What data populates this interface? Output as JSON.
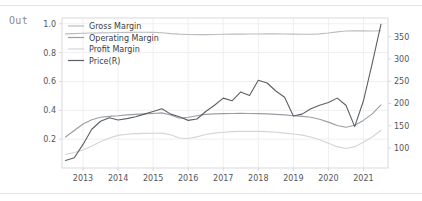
{
  "notebook": {
    "output_prompt": "Out"
  },
  "chart_data": {
    "type": "line",
    "title": "",
    "xlabel": "",
    "ylabel": "",
    "grid": true,
    "legend_position": "upper-left",
    "x": [
      2012.5,
      2012.75,
      2013.0,
      2013.25,
      2013.5,
      2013.75,
      2014.0,
      2014.25,
      2014.5,
      2014.75,
      2015.0,
      2015.25,
      2015.5,
      2015.75,
      2016.0,
      2016.25,
      2016.5,
      2016.75,
      2017.0,
      2017.25,
      2017.5,
      2017.75,
      2018.0,
      2018.25,
      2018.5,
      2018.75,
      2019.0,
      2019.25,
      2019.5,
      2019.75,
      2020.0,
      2020.25,
      2020.5,
      2020.75,
      2021.0,
      2021.25,
      2021.5
    ],
    "xticks": [
      "2013",
      "2014",
      "2015",
      "2016",
      "2017",
      "2018",
      "2019",
      "2020",
      "2021"
    ],
    "xtick_values": [
      2013,
      2014,
      2015,
      2016,
      2017,
      2018,
      2019,
      2020,
      2021
    ],
    "xlim": [
      2012.4,
      2021.7
    ],
    "left_axis": {
      "ticks": [
        "0.2",
        "0.4",
        "0.6",
        "0.8",
        "1.0"
      ],
      "tick_values": [
        0.2,
        0.4,
        0.6,
        0.8,
        1.0
      ],
      "ylim": [
        0.0,
        1.04
      ]
    },
    "right_axis": {
      "label": "Price(R)",
      "ticks": [
        "100",
        "150",
        "200",
        "250",
        "300",
        "350"
      ],
      "tick_values": [
        100,
        150,
        200,
        250,
        300,
        350
      ],
      "ylim": [
        55,
        392
      ]
    },
    "series": [
      {
        "name": "Gross Margin",
        "axis": "left",
        "color": "#b9bcc0",
        "values": [
          0.93,
          0.932,
          0.934,
          0.936,
          0.937,
          0.938,
          0.939,
          0.94,
          0.941,
          0.941,
          0.94,
          0.938,
          0.932,
          0.928,
          0.926,
          0.925,
          0.925,
          0.926,
          0.927,
          0.928,
          0.928,
          0.929,
          0.929,
          0.93,
          0.93,
          0.929,
          0.928,
          0.927,
          0.927,
          0.93,
          0.936,
          0.944,
          0.95,
          0.952,
          0.951,
          0.95,
          0.952
        ]
      },
      {
        "name": "Operating Margin",
        "axis": "left",
        "color": "#9a9ea4",
        "values": [
          0.215,
          0.26,
          0.305,
          0.335,
          0.352,
          0.358,
          0.362,
          0.368,
          0.372,
          0.375,
          0.378,
          0.382,
          0.368,
          0.345,
          0.352,
          0.362,
          0.372,
          0.375,
          0.377,
          0.378,
          0.379,
          0.378,
          0.377,
          0.375,
          0.372,
          0.368,
          0.362,
          0.358,
          0.352,
          0.338,
          0.318,
          0.295,
          0.282,
          0.296,
          0.33,
          0.375,
          0.437
        ]
      },
      {
        "name": "Profit Margin",
        "axis": "left",
        "color": "#d2d5d9",
        "values": [
          0.095,
          0.108,
          0.125,
          0.152,
          0.182,
          0.208,
          0.226,
          0.234,
          0.238,
          0.24,
          0.241,
          0.242,
          0.23,
          0.208,
          0.205,
          0.216,
          0.232,
          0.242,
          0.248,
          0.252,
          0.254,
          0.255,
          0.254,
          0.252,
          0.248,
          0.242,
          0.236,
          0.228,
          0.215,
          0.196,
          0.172,
          0.148,
          0.135,
          0.148,
          0.178,
          0.215,
          0.262
        ]
      },
      {
        "name": "Price(R)",
        "axis": "right",
        "color": "#5b6066",
        "values": [
          72,
          78,
          108,
          142,
          160,
          168,
          163,
          166,
          170,
          176,
          182,
          188,
          176,
          170,
          162,
          165,
          182,
          196,
          212,
          206,
          226,
          218,
          252,
          246,
          228,
          214,
          172,
          176,
          188,
          196,
          202,
          212,
          196,
          148,
          206,
          290,
          378
        ]
      }
    ]
  },
  "legend": {
    "items": [
      {
        "label": "Gross Margin",
        "color": "#b9bcc0"
      },
      {
        "label": "Operating Margin",
        "color": "#9a9ea4"
      },
      {
        "label": "Profit Margin",
        "color": "#d2d5d9"
      },
      {
        "label": "Price(R)",
        "color": "#5b6066"
      }
    ]
  },
  "style": {
    "background": "#ffffff",
    "grid_color": "#efeff1",
    "axis_color": "#d9d9dd",
    "tick_label_color": "#55555a",
    "separator_color": "#e6e6e6",
    "prompt_color": "#8a8a8a"
  }
}
